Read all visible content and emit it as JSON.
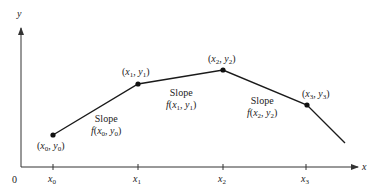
{
  "diagram": {
    "type": "piecewise-linear Euler method illustration",
    "axes": {
      "x_label": "x",
      "y_label": "y",
      "origin_label": "0"
    },
    "ticks": [
      {
        "label": "x",
        "sub": "0"
      },
      {
        "label": "x",
        "sub": "1"
      },
      {
        "label": "x",
        "sub": "2"
      },
      {
        "label": "x",
        "sub": "3"
      }
    ],
    "points": [
      {
        "text": "(x0, y0)",
        "x_sub": "0",
        "y_sub": "0"
      },
      {
        "text": "(x1, y1)",
        "x_sub": "1",
        "y_sub": "1"
      },
      {
        "text": "(x2, y2)",
        "x_sub": "2",
        "y_sub": "2"
      },
      {
        "text": "(x3, y3)",
        "x_sub": "3",
        "y_sub": "3"
      }
    ],
    "slopes": [
      {
        "title": "Slope",
        "expr": "f(x0, y0)",
        "sub": "0"
      },
      {
        "title": "Slope",
        "expr": "f(x1, y1)",
        "sub": "1"
      },
      {
        "title": "Slope",
        "expr": "f(x2, y2)",
        "sub": "2"
      }
    ],
    "colors": {
      "line": "#1a1a1a",
      "axis": "#333333",
      "text": "#222222"
    }
  }
}
